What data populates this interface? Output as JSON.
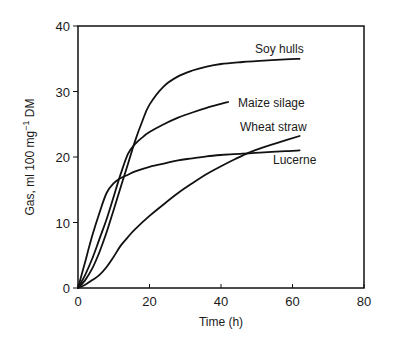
{
  "chart_data": {
    "type": "line",
    "title": "",
    "xlabel": "Time (h)",
    "ylabel": "Gas, ml 100 mg⁻¹ DM",
    "ylabel_parts": {
      "pre": "Gas, ml 100 mg",
      "sup": "−1",
      "post": " DM"
    },
    "xlim": [
      0,
      80
    ],
    "ylim": [
      0,
      40
    ],
    "xticks": [
      0,
      20,
      40,
      60,
      80
    ],
    "yticks": [
      0,
      10,
      20,
      30,
      40
    ],
    "grid": false,
    "legend_position": "inline labels at curve ends",
    "series": [
      {
        "name": "Soy hulls",
        "x": [
          0,
          2,
          4,
          6,
          8,
          10,
          12,
          14,
          16,
          18,
          20,
          24,
          28,
          32,
          36,
          40,
          46,
          52,
          58,
          62
        ],
        "values": [
          0,
          1.2,
          3,
          5.5,
          8.5,
          12,
          15.5,
          19,
          22.5,
          25.5,
          28,
          30.8,
          32.3,
          33.2,
          33.8,
          34.2,
          34.5,
          34.7,
          34.9,
          35
        ]
      },
      {
        "name": "Maize silage",
        "x": [
          0,
          2,
          4,
          6,
          8,
          10,
          12,
          14,
          16,
          18,
          20,
          24,
          28,
          32,
          36,
          40,
          42
        ],
        "values": [
          0,
          2,
          4.5,
          7.5,
          10.5,
          14,
          17.5,
          20.5,
          22,
          23,
          23.8,
          25,
          26,
          26.8,
          27.5,
          28.1,
          28.4
        ]
      },
      {
        "name": "Wheat straw",
        "x": [
          0,
          2,
          4,
          6,
          8,
          10,
          12,
          14,
          16,
          20,
          24,
          28,
          32,
          36,
          40,
          44,
          48,
          52,
          56,
          62
        ],
        "values": [
          0,
          0.5,
          1.2,
          2,
          3.2,
          4.8,
          6.5,
          7.8,
          9,
          11,
          12.8,
          14.5,
          16,
          17.4,
          18.6,
          19.7,
          20.7,
          21.5,
          22.2,
          23.2
        ]
      },
      {
        "name": "Lucerne",
        "x": [
          0,
          2,
          4,
          6,
          8,
          10,
          12,
          14,
          16,
          20,
          24,
          28,
          32,
          36,
          40,
          46,
          52,
          58,
          62
        ],
        "values": [
          0,
          4,
          8,
          11.5,
          14.5,
          16,
          16.8,
          17.3,
          17.8,
          18.5,
          19,
          19.5,
          19.8,
          20.1,
          20.3,
          20.5,
          20.7,
          20.9,
          21
        ]
      }
    ],
    "label_positions": {
      "Soy hulls": {
        "x": 255,
        "y": 53
      },
      "Maize silage": {
        "x": 238,
        "y": 107
      },
      "Wheat straw": {
        "x": 240,
        "y": 131
      },
      "Lucerne": {
        "x": 273,
        "y": 164
      }
    }
  }
}
